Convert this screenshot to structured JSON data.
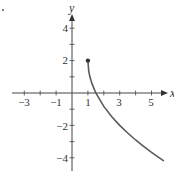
{
  "chart_data": {
    "type": "line",
    "title": "",
    "xlabel": "x",
    "ylabel": "y",
    "xlim": [
      -3.9,
      5.9
    ],
    "ylim": [
      -4.8,
      4.6
    ],
    "grid": false,
    "legend": null,
    "x_tick_labels": [
      "-3",
      "-1",
      "1",
      "3",
      "5"
    ],
    "x_tick_values": [
      -3,
      -1,
      1,
      3,
      5
    ],
    "x_minor_ticks": [
      -3,
      -2,
      -1,
      1,
      2,
      3,
      4,
      5
    ],
    "y_tick_labels": [
      "4",
      "2",
      "-2",
      "-4"
    ],
    "y_tick_values": [
      4,
      2,
      -2,
      -4
    ],
    "y_minor_ticks": [
      4,
      3,
      2,
      1,
      -1,
      -2,
      -3,
      -4
    ],
    "series": [
      {
        "name": "f(x)",
        "color": "#555555",
        "start_point": {
          "x": 1,
          "y": 2,
          "marker": "closed-dot"
        },
        "x": [
          1,
          1.05,
          1.125,
          1.25,
          1.5,
          2,
          2.5,
          3,
          3.5,
          4,
          4.5,
          5,
          5.5,
          5.75
        ],
        "y": [
          2,
          1.37,
          1.0,
          0.59,
          0.0,
          -0.83,
          -1.46,
          -2.0,
          -2.47,
          -2.9,
          -3.29,
          -3.66,
          -4.0,
          -4.17
        ]
      }
    ],
    "annotations": [
      {
        "text": "x",
        "position": "end of x-axis arrow"
      },
      {
        "text": "y",
        "position": "top of y-axis arrow"
      }
    ]
  },
  "labels": {
    "x_axis": "x",
    "y_axis": "y",
    "x_ticks": [
      "−3",
      "−1",
      "1",
      "3",
      "5"
    ],
    "y_ticks": [
      "4",
      "2",
      "−2",
      "−4"
    ]
  },
  "colors": {
    "axis": "#444444",
    "curve": "#5a5a5a",
    "text": "#333333"
  }
}
